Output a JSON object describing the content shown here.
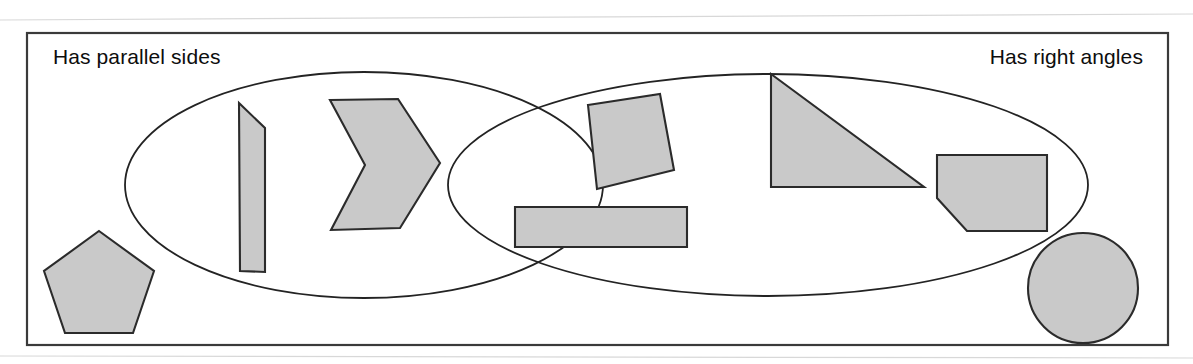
{
  "diagram": {
    "type": "venn-diagram",
    "canvas": {
      "width": 1193,
      "height": 364,
      "background": "#ffffff"
    },
    "frame": {
      "x": 27,
      "y": 33,
      "width": 1141,
      "height": 312,
      "stroke": "#3a3a3a",
      "fill": "#ffffff"
    },
    "palette": {
      "shape_fill": "#c9c9c9",
      "shape_stroke": "#2b2b2b",
      "outline_stroke": "#232323",
      "frame_stroke": "#3a3a3a",
      "text": "#0d0d0d"
    },
    "labels": {
      "left": "Has parallel sides",
      "right": "Has right angles",
      "left_pos": {
        "x": 53,
        "y": 64
      },
      "right_pos": {
        "x": 1143,
        "y": 64
      }
    },
    "sets": [
      {
        "name": "left-set",
        "label": "Has parallel sides",
        "shape": "ellipse",
        "cx": 364,
        "cy": 185,
        "rx": 239,
        "ry": 113
      },
      {
        "name": "right-set",
        "label": "Has right angles",
        "shape": "ellipse",
        "cx": 768,
        "cy": 185,
        "rx": 320,
        "ry": 111
      }
    ],
    "intersection": {
      "upper_crossing": {
        "x": 603,
        "y": 84
      },
      "lower_crossing": {
        "x": 603,
        "y": 285
      }
    },
    "members": [
      {
        "name": "trapezoid",
        "region": "left-only",
        "kind": "polygon",
        "points": "239,103 265,128 265,272 240,271"
      },
      {
        "name": "chevron",
        "region": "left-only",
        "kind": "polygon",
        "points": "330,100 398,99 440,163 400,228 331,230 365,165"
      },
      {
        "name": "rotated-square",
        "region": "intersection",
        "kind": "polygon",
        "points": "588,105 660,94 674,170 597,189"
      },
      {
        "name": "horizontal-rectangle",
        "region": "intersection",
        "kind": "polygon",
        "points": "515,207 687,207 687,247 515,247"
      },
      {
        "name": "right-triangle",
        "region": "right-only",
        "kind": "polygon",
        "points": "771,74 771,187 924,187"
      },
      {
        "name": "cut-corner-pentagon",
        "region": "right-only",
        "kind": "polygon",
        "points": "937,155 1047,155 1047,231 967,231 937,198"
      },
      {
        "name": "pentagon",
        "region": "outside",
        "kind": "polygon",
        "points": "99,231 154,271 133,333 65,333 44,271"
      },
      {
        "name": "circle",
        "region": "outside",
        "kind": "circle",
        "cx": 1083,
        "cy": 288,
        "r": 55
      }
    ]
  }
}
